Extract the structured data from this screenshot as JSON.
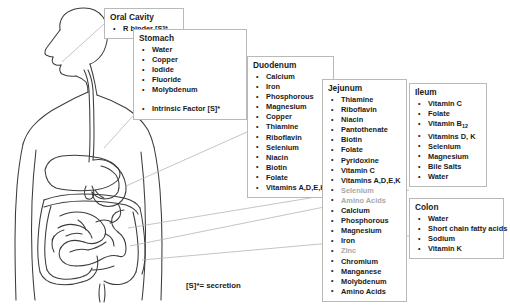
{
  "figure": {
    "alt_name": "human-digestive-tract-outline"
  },
  "boxes": [
    {
      "id": "oral",
      "title": "Oral Cavity",
      "items": [
        {
          "text": "R binder [S]*",
          "faded": false,
          "spaced": false
        }
      ]
    },
    {
      "id": "stomach",
      "title": "Stomach",
      "items": [
        {
          "text": "Water",
          "faded": false,
          "spaced": false
        },
        {
          "text": "Copper",
          "faded": false,
          "spaced": false
        },
        {
          "text": "Iodide",
          "faded": false,
          "spaced": false
        },
        {
          "text": "Fluoride",
          "faded": false,
          "spaced": false
        },
        {
          "text": "Molybdenum",
          "faded": false,
          "spaced": false
        },
        {
          "text": "Intrinsic Factor [S]*",
          "faded": false,
          "spaced": true
        }
      ]
    },
    {
      "id": "duodenum",
      "title": "Duodenum",
      "items": [
        {
          "text": "Calcium",
          "faded": false,
          "spaced": false
        },
        {
          "text": "Iron",
          "faded": false,
          "spaced": false
        },
        {
          "text": "Phosphorous",
          "faded": false,
          "spaced": false
        },
        {
          "text": "Magnesium",
          "faded": false,
          "spaced": false
        },
        {
          "text": "Copper",
          "faded": false,
          "spaced": false
        },
        {
          "text": "Thiamine",
          "faded": false,
          "spaced": false
        },
        {
          "text": "Riboflavin",
          "faded": false,
          "spaced": false
        },
        {
          "text": "Selenium",
          "faded": false,
          "spaced": false
        },
        {
          "text": "Niacin",
          "faded": false,
          "spaced": false
        },
        {
          "text": "Biotin",
          "faded": false,
          "spaced": false
        },
        {
          "text": "Folate",
          "faded": false,
          "spaced": false
        },
        {
          "text": "Vitamins A,D,E,K",
          "faded": false,
          "spaced": false
        }
      ]
    },
    {
      "id": "jejunum",
      "title": "Jejunum",
      "items": [
        {
          "text": "Thiamine",
          "faded": false,
          "spaced": false
        },
        {
          "text": "Riboflavin",
          "faded": false,
          "spaced": false
        },
        {
          "text": "Niacin",
          "faded": false,
          "spaced": false
        },
        {
          "text": "Pantothenate",
          "faded": false,
          "spaced": false
        },
        {
          "text": "Biotin",
          "faded": false,
          "spaced": false
        },
        {
          "text": "Folate",
          "faded": false,
          "spaced": false
        },
        {
          "text": "Pyridoxine",
          "faded": false,
          "spaced": false
        },
        {
          "text": "Vitamin C",
          "faded": false,
          "spaced": false
        },
        {
          "text": "Vitamins A,D,E,K",
          "faded": false,
          "spaced": false
        },
        {
          "text": "Selenium",
          "faded": true,
          "spaced": false
        },
        {
          "text": "Amino Acids",
          "faded": true,
          "spaced": false
        },
        {
          "text": "Calcium",
          "faded": false,
          "spaced": false
        },
        {
          "text": "Phosphorous",
          "faded": false,
          "spaced": false
        },
        {
          "text": "Magnesium",
          "faded": false,
          "spaced": false
        },
        {
          "text": "Iron",
          "faded": false,
          "spaced": false
        },
        {
          "text": "Zinc",
          "faded": true,
          "spaced": false
        },
        {
          "text": "Chromium",
          "faded": false,
          "spaced": false
        },
        {
          "text": "Manganese",
          "faded": false,
          "spaced": false
        },
        {
          "text": "Molybdenum",
          "faded": false,
          "spaced": false
        },
        {
          "text": "Amino Acids",
          "faded": false,
          "spaced": false
        }
      ]
    },
    {
      "id": "ileum",
      "title": "Ileum",
      "items": [
        {
          "text": "Vitamin C",
          "faded": false,
          "spaced": false
        },
        {
          "text": "Folate",
          "faded": false,
          "spaced": false
        },
        {
          "text": "Vitamin B12",
          "faded": false,
          "spaced": false,
          "subscript": "12",
          "base": "Vitamin B"
        },
        {
          "text": "Vitamins D, K",
          "faded": false,
          "spaced": false
        },
        {
          "text": "Selenium",
          "faded": false,
          "spaced": false
        },
        {
          "text": "Magnesium",
          "faded": false,
          "spaced": false
        },
        {
          "text": "Bile Salts",
          "faded": false,
          "spaced": false
        },
        {
          "text": "Water",
          "faded": false,
          "spaced": false
        }
      ]
    },
    {
      "id": "colon",
      "title": "Colon",
      "items": [
        {
          "text": "Water",
          "faded": false,
          "spaced": false
        },
        {
          "text": "Short chain fatty acids",
          "faded": false,
          "spaced": false
        },
        {
          "text": "Sodium",
          "faded": false,
          "spaced": false
        },
        {
          "text": "Vitamin K",
          "faded": false,
          "spaced": false
        }
      ]
    }
  ],
  "footnote": "[S]*= secretion",
  "colors": {
    "text": "#1a1a1a",
    "faded_text": "#a8a8a8",
    "box_border": "#b9b9b9",
    "leader_line": "#b0b0b0",
    "anatomy_line": "#3c3c3c",
    "background": "#ffffff"
  }
}
